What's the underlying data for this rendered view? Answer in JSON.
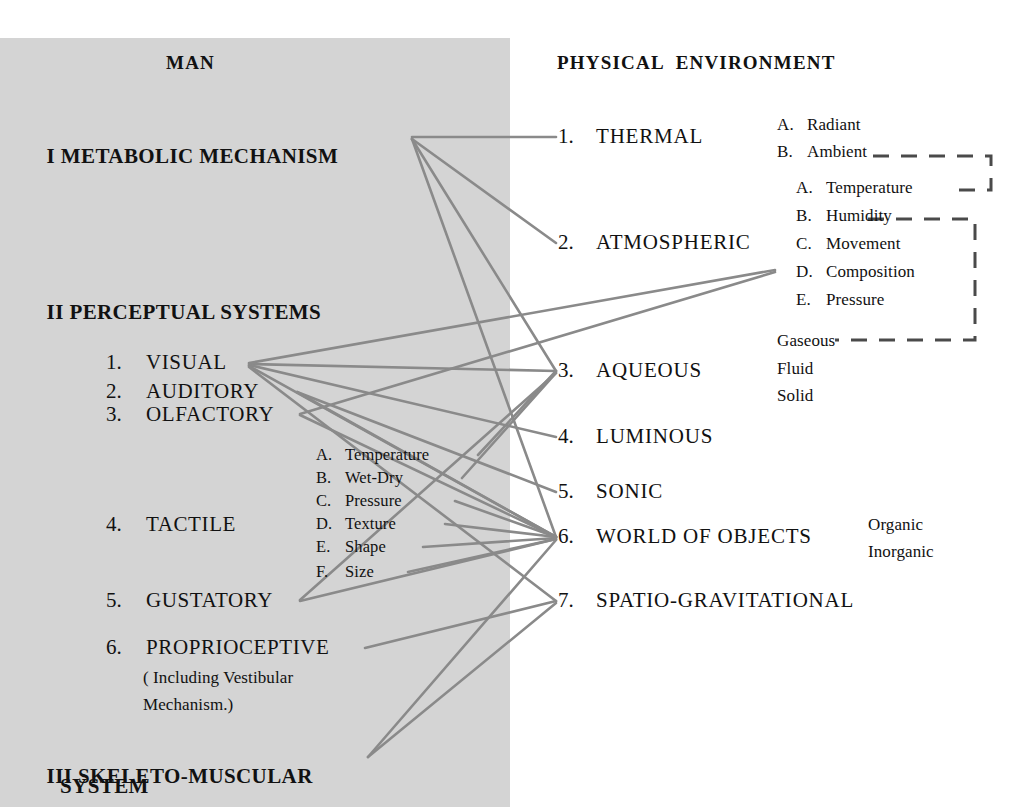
{
  "diagram": {
    "title_left": "MAN",
    "title_right": "PHYSICAL  ENVIRONMENT",
    "colors": {
      "panel_background": "#d4d4d4",
      "page_background": "#ffffff",
      "link_line": "#8a8a8a",
      "dash_bracket": "#4a4a4a",
      "text": "#111111"
    }
  },
  "man": {
    "section_1": {
      "numeral": "I",
      "label": "METABOLIC MECHANISM"
    },
    "section_2": {
      "numeral": "II",
      "label": "PERCEPTUAL SYSTEMS"
    },
    "section_3": {
      "numeral": "III",
      "label_line1": "SKELETO-MUSCULAR",
      "label_line2": "SYSTEM"
    },
    "perceptual_systems": [
      {
        "num": "1.",
        "label": "VISUAL"
      },
      {
        "num": "2.",
        "label": "AUDITORY"
      },
      {
        "num": "3.",
        "label": "OLFACTORY"
      },
      {
        "num": "4.",
        "label": "TACTILE"
      },
      {
        "num": "5.",
        "label": "GUSTATORY"
      },
      {
        "num": "6.",
        "label": "PROPRIOCEPTIVE"
      }
    ],
    "proprioceptive_note_line1": "( Including Vestibular",
    "proprioceptive_note_line2": "Mechanism.)",
    "tactile_sub": [
      {
        "letter": "A.",
        "label": "Temperature"
      },
      {
        "letter": "B.",
        "label": "Wet-Dry"
      },
      {
        "letter": "C.",
        "label": "Pressure"
      },
      {
        "letter": "D.",
        "label": "Texture"
      },
      {
        "letter": "E.",
        "label": "Shape"
      },
      {
        "letter": "F.",
        "label": "Size"
      }
    ]
  },
  "environment": {
    "items": [
      {
        "num": "1.",
        "label": "THERMAL"
      },
      {
        "num": "2.",
        "label": "ATMOSPHERIC"
      },
      {
        "num": "3.",
        "label": "AQUEOUS"
      },
      {
        "num": "4.",
        "label": "LUMINOUS"
      },
      {
        "num": "5.",
        "label": "SONIC"
      },
      {
        "num": "6.",
        "label": "WORLD OF OBJECTS"
      },
      {
        "num": "7.",
        "label": "SPATIO-GRAVITATIONAL"
      }
    ],
    "thermal_sub": [
      {
        "letter": "A.",
        "label": "Radiant"
      },
      {
        "letter": "B.",
        "label": "Ambient"
      }
    ],
    "atmospheric_sub": [
      {
        "letter": "A.",
        "label": "Temperature"
      },
      {
        "letter": "B.",
        "label": "Humidity"
      },
      {
        "letter": "C.",
        "label": "Movement"
      },
      {
        "letter": "D.",
        "label": "Composition"
      },
      {
        "letter": "E.",
        "label": "Pressure"
      }
    ],
    "aqueous_sub": [
      {
        "label": "Gaseous"
      },
      {
        "label": "Fluid"
      },
      {
        "label": "Solid"
      }
    ],
    "objects_sub": [
      {
        "label": "Organic"
      },
      {
        "label": "Inorganic"
      }
    ]
  },
  "links": [
    {
      "from": "metabolic-mechanism",
      "to": "thermal",
      "x1": 412,
      "y1": 137,
      "x2": 556,
      "y2": 137
    },
    {
      "from": "metabolic-mechanism",
      "to": "atmospheric",
      "x1": 412,
      "y1": 139,
      "x2": 556,
      "y2": 243
    },
    {
      "from": "metabolic-mechanism",
      "to": "aqueous",
      "x1": 412,
      "y1": 139,
      "x2": 556,
      "y2": 371
    },
    {
      "from": "metabolic-mechanism",
      "to": "objects",
      "x1": 412,
      "y1": 139,
      "x2": 556,
      "y2": 537
    },
    {
      "from": "visual",
      "to": "atmospheric-composition",
      "x1": 249,
      "y1": 363,
      "x2": 775,
      "y2": 270
    },
    {
      "from": "visual",
      "to": "aqueous",
      "x1": 249,
      "y1": 364,
      "x2": 556,
      "y2": 371
    },
    {
      "from": "visual",
      "to": "luminous",
      "x1": 249,
      "y1": 365,
      "x2": 556,
      "y2": 437
    },
    {
      "from": "visual",
      "to": "objects",
      "x1": 249,
      "y1": 366,
      "x2": 556,
      "y2": 537
    },
    {
      "from": "visual",
      "to": "spatio-gravitational",
      "x1": 249,
      "y1": 367,
      "x2": 556,
      "y2": 601
    },
    {
      "from": "auditory",
      "to": "sonic",
      "x1": 297,
      "y1": 392,
      "x2": 556,
      "y2": 492
    },
    {
      "from": "auditory",
      "to": "objects",
      "x1": 297,
      "y1": 392,
      "x2": 556,
      "y2": 537
    },
    {
      "from": "olfactory",
      "to": "atmospheric-composition",
      "x1": 300,
      "y1": 414,
      "x2": 775,
      "y2": 272
    },
    {
      "from": "olfactory",
      "to": "objects",
      "x1": 300,
      "y1": 415,
      "x2": 556,
      "y2": 537
    },
    {
      "from": "tactile-temperature",
      "to": "aqueous",
      "x1": 478,
      "y1": 455,
      "x2": 556,
      "y2": 371
    },
    {
      "from": "tactile-wet-dry",
      "to": "aqueous",
      "x1": 462,
      "y1": 478,
      "x2": 556,
      "y2": 373
    },
    {
      "from": "tactile-pressure",
      "to": "objects",
      "x1": 455,
      "y1": 501,
      "x2": 556,
      "y2": 537
    },
    {
      "from": "tactile-texture",
      "to": "objects",
      "x1": 445,
      "y1": 524,
      "x2": 556,
      "y2": 537
    },
    {
      "from": "tactile-shape",
      "to": "objects",
      "x1": 423,
      "y1": 547,
      "x2": 556,
      "y2": 538
    },
    {
      "from": "tactile-size",
      "to": "objects",
      "x1": 408,
      "y1": 572,
      "x2": 556,
      "y2": 539
    },
    {
      "from": "gustatory",
      "to": "objects",
      "x1": 300,
      "y1": 601,
      "x2": 556,
      "y2": 539
    },
    {
      "from": "gustatory",
      "to": "aqueous",
      "x1": 300,
      "y1": 600,
      "x2": 556,
      "y2": 373
    },
    {
      "from": "proprioceptive",
      "to": "spatio-gravitational",
      "x1": 365,
      "y1": 648,
      "x2": 556,
      "y2": 601
    },
    {
      "from": "skeleto-muscular",
      "to": "objects",
      "x1": 368,
      "y1": 757,
      "x2": 556,
      "y2": 540
    },
    {
      "from": "skeleto-muscular",
      "to": "spatio-gravitational",
      "x1": 368,
      "y1": 757,
      "x2": 556,
      "y2": 603
    }
  ],
  "brackets": {
    "thermal_to_atmospheric": "dashed connector from B. Ambient to A. Temperature",
    "humidity_to_gaseous": "dashed connector from B. Humidity down to Gaseous"
  }
}
